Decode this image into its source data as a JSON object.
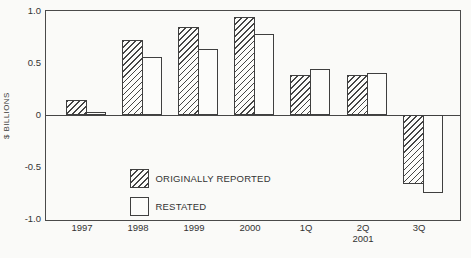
{
  "chart_data": {
    "type": "bar",
    "title": "",
    "xlabel": "",
    "ylabel": "$ BILLIONS",
    "ylim": [
      -1.0,
      1.0
    ],
    "yticks": [
      1.0,
      0.5,
      0.0,
      -0.5,
      -1.0
    ],
    "ytick_labels": [
      "1.0",
      "0.5",
      "0",
      "-0.5",
      "-1.0"
    ],
    "categories": [
      "1997",
      "1998",
      "1999",
      "2000",
      "1Q",
      "2Q",
      "3Q"
    ],
    "x_sublabel": {
      "text": "2001",
      "under_index": 5
    },
    "series": [
      {
        "name": "ORIGINALLY REPORTED",
        "pattern": "hatched",
        "values": [
          0.14,
          0.72,
          0.85,
          0.94,
          0.38,
          0.38,
          -0.66
        ]
      },
      {
        "name": "RESTATED",
        "pattern": "plain",
        "values": [
          0.03,
          0.56,
          0.63,
          0.78,
          0.44,
          0.4,
          -0.75
        ]
      }
    ],
    "legend_position": "inside-lower-left",
    "grid": "zero-baseline-only",
    "colors": {
      "line": "#3f3f3f",
      "text": "#333333",
      "background": "#fafaf8",
      "bar_fill": "#fcfcfa"
    }
  }
}
